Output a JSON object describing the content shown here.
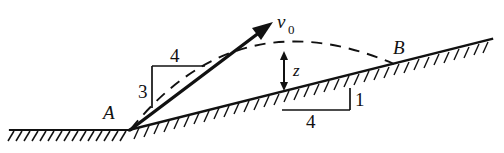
{
  "figure": {
    "background_color": "#ffffff",
    "ink_color": "#111111",
    "width": 504,
    "height": 153
  },
  "labels": {
    "point_a": "A",
    "point_b": "B",
    "velocity": "v",
    "velocity_subscript": "0",
    "height_z": "z",
    "launch_rise": "3",
    "launch_run": "4",
    "incline_run": "4",
    "incline_rise": "1"
  },
  "geometry": {
    "ground_line": {
      "x1": 10,
      "y1": 130,
      "x2": 130,
      "y2": 130
    },
    "incline_line": {
      "x1": 130,
      "y1": 130,
      "x2": 492,
      "y2": 40
    },
    "point_a": {
      "x": 130,
      "y": 130
    },
    "point_b": {
      "x": 394,
      "y": 64
    },
    "velocity_arrow": {
      "x1": 130,
      "y1": 130,
      "x2": 272,
      "y2": 23
    },
    "trajectory": {
      "start_x": 130,
      "start_y": 130,
      "apex_x": 292,
      "apex_y": 45,
      "end_x": 394,
      "end_y": 64
    },
    "launch_triangle": {
      "corner_x": 152,
      "corner_y": 108,
      "top_y": 66,
      "right_x": 205
    },
    "incline_triangle": {
      "left_x": 282,
      "right_x": 350,
      "base_y": 110,
      "top_y": 88
    },
    "z_arrow": {
      "x": 284,
      "y_top": 54,
      "y_bottom": 88
    }
  },
  "elements": {
    "ground_name": "horizontal-ground-line",
    "incline_name": "inclined-plane-line",
    "hatching_name": "ground-hatching",
    "trajectory_name": "projectile-trajectory-dashed",
    "velocity_name": "initial-velocity-vector"
  }
}
